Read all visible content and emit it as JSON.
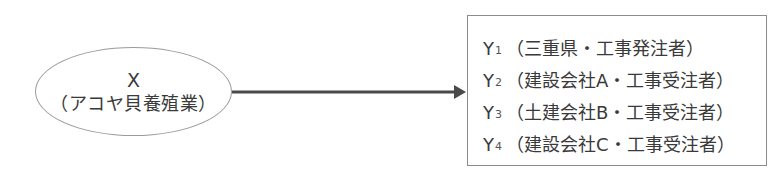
{
  "source_node": {
    "label": "X",
    "description": "（アコヤ貝養殖業）"
  },
  "arrow": {
    "color": "#4a4a4a",
    "direction": "source-to-targets"
  },
  "target_box": {
    "items": [
      {
        "letter": "Y",
        "index": "1",
        "description": "（三重県・工事発注者）"
      },
      {
        "letter": "Y",
        "index": "2",
        "description": "（建設会社A・工事受注者）"
      },
      {
        "letter": "Y",
        "index": "3",
        "description": "（土建会社B・工事受注者）"
      },
      {
        "letter": "Y",
        "index": "4",
        "description": "（建設会社C・工事受注者）"
      }
    ]
  }
}
